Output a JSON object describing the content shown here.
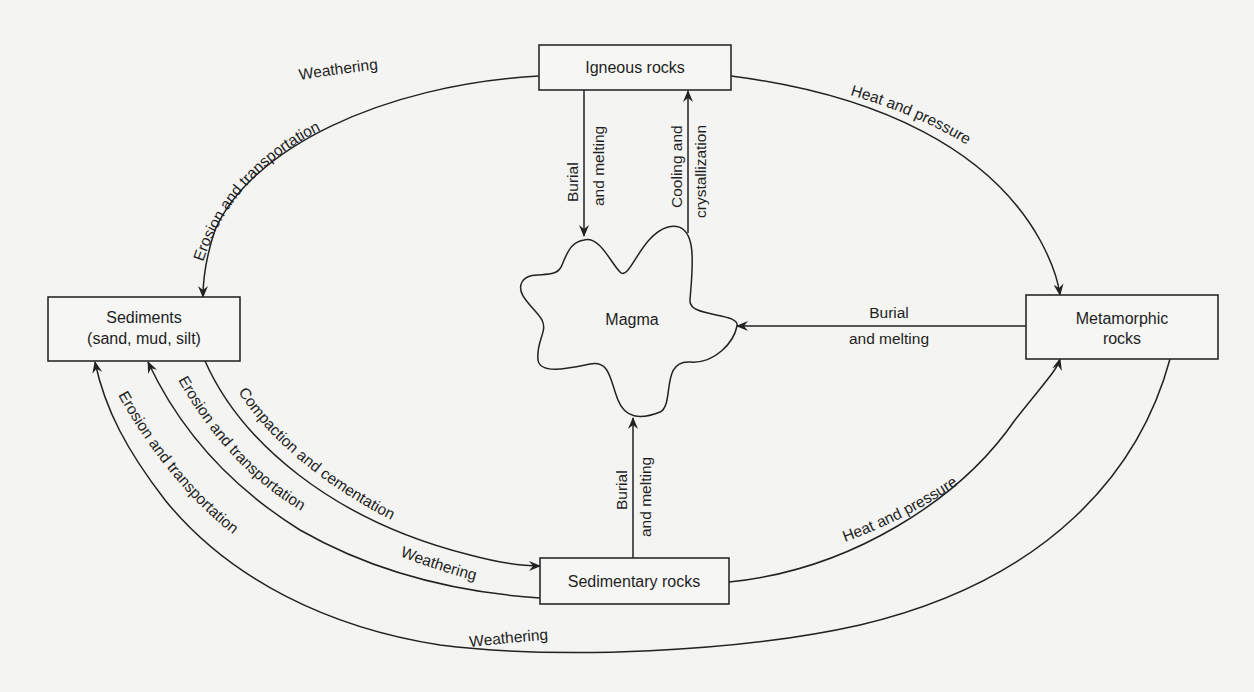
{
  "diagram": {
    "type": "rock-cycle",
    "nodes": {
      "igneous": {
        "label": "Igneous rocks"
      },
      "sediments": {
        "line1": "Sediments",
        "line2": "(sand, mud, silt)"
      },
      "magma": {
        "label": "Magma"
      },
      "metamorphic": {
        "line1": "Metamorphic",
        "line2": "rocks"
      },
      "sedimentary": {
        "label": "Sedimentary rocks"
      }
    },
    "edges": {
      "igneous_to_sediments_weathering": "Weathering",
      "igneous_to_sediments_erosion": "Erosion and transportation",
      "igneous_to_magma_l1": "Burial",
      "igneous_to_magma_l2": "and melting",
      "magma_to_igneous_l1": "Cooling and",
      "magma_to_igneous_l2": "crystallization",
      "igneous_to_metamorphic": "Heat and pressure",
      "metamorphic_to_magma_l1": "Burial",
      "metamorphic_to_magma_l2": "and melting",
      "sedimentary_to_magma_l1": "Burial",
      "sedimentary_to_magma_l2": "and melting",
      "sediments_to_sedimentary": "Compaction and cementation",
      "sedimentary_to_sediments_erosion": "Erosion and transportation",
      "sedimentary_to_sediments_weathering": "Weathering",
      "metamorphic_to_sediments_erosion": "Erosion and transportation",
      "metamorphic_to_sediments_weathering": "Weathering",
      "sedimentary_to_metamorphic": "Heat and pressure"
    }
  }
}
